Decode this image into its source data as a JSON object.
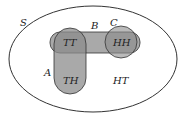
{
  "diagram": {
    "type": "venn",
    "sample_space_label": "S",
    "sets": [
      {
        "name": "A",
        "label": "A"
      },
      {
        "name": "B",
        "label": "B"
      },
      {
        "name": "C",
        "label": "C"
      }
    ],
    "outcomes": [
      {
        "label": "TT",
        "in": [
          "A",
          "B"
        ]
      },
      {
        "label": "HH",
        "in": [
          "B",
          "C"
        ]
      },
      {
        "label": "TH",
        "in": [
          "A"
        ]
      },
      {
        "label": "HT",
        "in": []
      }
    ],
    "colors": {
      "fill": "#8c8c8c",
      "stroke": "#333333",
      "background": "#ffffff"
    }
  }
}
